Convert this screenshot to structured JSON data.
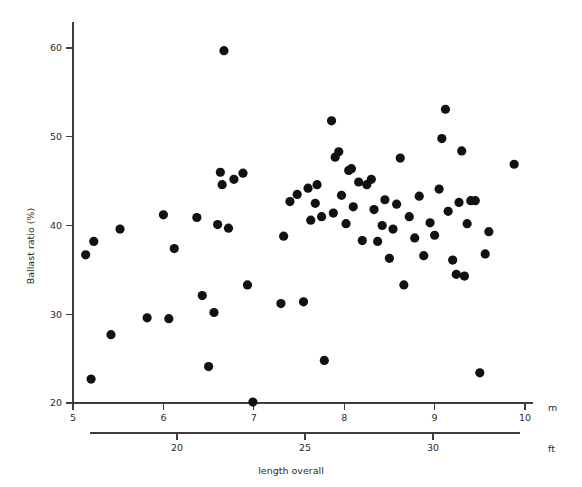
{
  "chart_data": {
    "type": "scatter",
    "title": "",
    "xlabel": "length overall",
    "ylabel": "Ballast ratio (%)",
    "x_unit_primary": "m",
    "x_unit_secondary": "ft",
    "xlim": [
      5,
      10
    ],
    "ylim": [
      20,
      61.5
    ],
    "x_ticks_m": [
      5,
      6,
      7,
      8,
      9,
      10
    ],
    "x_tick_labels_m": [
      "5",
      "6",
      "7",
      "8",
      "9",
      "10"
    ],
    "x_ticks_ft": [
      20,
      25,
      30
    ],
    "x_tick_labels_ft": [
      "20",
      "25",
      "30"
    ],
    "y_ticks": [
      20,
      30,
      40,
      50,
      60
    ],
    "y_tick_labels": [
      "20",
      "30",
      "40",
      "50",
      "60"
    ],
    "grid": false,
    "legend": null,
    "marker": {
      "shape": "circle",
      "color": "#111111",
      "size_px": 4.6
    },
    "points": [
      {
        "x": 5.14,
        "y": 36.7
      },
      {
        "x": 5.2,
        "y": 22.7
      },
      {
        "x": 5.23,
        "y": 38.2
      },
      {
        "x": 5.42,
        "y": 27.7
      },
      {
        "x": 5.52,
        "y": 39.6
      },
      {
        "x": 5.82,
        "y": 29.6
      },
      {
        "x": 6.0,
        "y": 41.2
      },
      {
        "x": 6.06,
        "y": 29.5
      },
      {
        "x": 6.12,
        "y": 37.4
      },
      {
        "x": 6.37,
        "y": 40.9
      },
      {
        "x": 6.43,
        "y": 32.1
      },
      {
        "x": 6.5,
        "y": 24.1
      },
      {
        "x": 6.56,
        "y": 30.2
      },
      {
        "x": 6.6,
        "y": 40.1
      },
      {
        "x": 6.63,
        "y": 46.0
      },
      {
        "x": 6.65,
        "y": 44.6
      },
      {
        "x": 6.67,
        "y": 59.7
      },
      {
        "x": 6.72,
        "y": 39.7
      },
      {
        "x": 6.78,
        "y": 45.2
      },
      {
        "x": 6.88,
        "y": 45.9
      },
      {
        "x": 6.93,
        "y": 33.3
      },
      {
        "x": 6.99,
        "y": 20.1
      },
      {
        "x": 7.3,
        "y": 31.2
      },
      {
        "x": 7.33,
        "y": 38.8
      },
      {
        "x": 7.4,
        "y": 42.7
      },
      {
        "x": 7.48,
        "y": 43.5
      },
      {
        "x": 7.55,
        "y": 31.4
      },
      {
        "x": 7.6,
        "y": 44.2
      },
      {
        "x": 7.63,
        "y": 40.6
      },
      {
        "x": 7.68,
        "y": 42.5
      },
      {
        "x": 7.7,
        "y": 44.6
      },
      {
        "x": 7.75,
        "y": 41.0
      },
      {
        "x": 7.78,
        "y": 24.8
      },
      {
        "x": 7.86,
        "y": 51.8
      },
      {
        "x": 7.88,
        "y": 41.4
      },
      {
        "x": 7.9,
        "y": 47.7
      },
      {
        "x": 7.94,
        "y": 48.3
      },
      {
        "x": 7.97,
        "y": 43.4
      },
      {
        "x": 8.02,
        "y": 40.2
      },
      {
        "x": 8.05,
        "y": 46.2
      },
      {
        "x": 8.08,
        "y": 46.4
      },
      {
        "x": 8.1,
        "y": 42.1
      },
      {
        "x": 8.16,
        "y": 44.9
      },
      {
        "x": 8.2,
        "y": 38.3
      },
      {
        "x": 8.25,
        "y": 44.6
      },
      {
        "x": 8.3,
        "y": 45.2
      },
      {
        "x": 8.33,
        "y": 41.8
      },
      {
        "x": 8.37,
        "y": 38.2
      },
      {
        "x": 8.42,
        "y": 40.0
      },
      {
        "x": 8.45,
        "y": 42.9
      },
      {
        "x": 8.5,
        "y": 36.3
      },
      {
        "x": 8.54,
        "y": 39.6
      },
      {
        "x": 8.58,
        "y": 42.4
      },
      {
        "x": 8.62,
        "y": 47.6
      },
      {
        "x": 8.66,
        "y": 33.3
      },
      {
        "x": 8.72,
        "y": 41.0
      },
      {
        "x": 8.78,
        "y": 38.6
      },
      {
        "x": 8.83,
        "y": 43.3
      },
      {
        "x": 8.88,
        "y": 36.6
      },
      {
        "x": 8.95,
        "y": 40.3
      },
      {
        "x": 9.0,
        "y": 38.9
      },
      {
        "x": 9.05,
        "y": 44.1
      },
      {
        "x": 9.08,
        "y": 49.8
      },
      {
        "x": 9.12,
        "y": 53.1
      },
      {
        "x": 9.15,
        "y": 41.6
      },
      {
        "x": 9.2,
        "y": 36.1
      },
      {
        "x": 9.24,
        "y": 34.5
      },
      {
        "x": 9.27,
        "y": 42.6
      },
      {
        "x": 9.3,
        "y": 48.4
      },
      {
        "x": 9.33,
        "y": 34.3
      },
      {
        "x": 9.36,
        "y": 40.2
      },
      {
        "x": 9.4,
        "y": 42.8
      },
      {
        "x": 9.45,
        "y": 42.8
      },
      {
        "x": 9.5,
        "y": 23.4
      },
      {
        "x": 9.56,
        "y": 36.8
      },
      {
        "x": 9.6,
        "y": 39.3
      },
      {
        "x": 9.88,
        "y": 46.9
      }
    ]
  },
  "axes": {
    "y_axis_label": "Ballast ratio (%)",
    "x_axis_label": "length overall",
    "m_unit": "m",
    "ft_unit": "ft"
  }
}
